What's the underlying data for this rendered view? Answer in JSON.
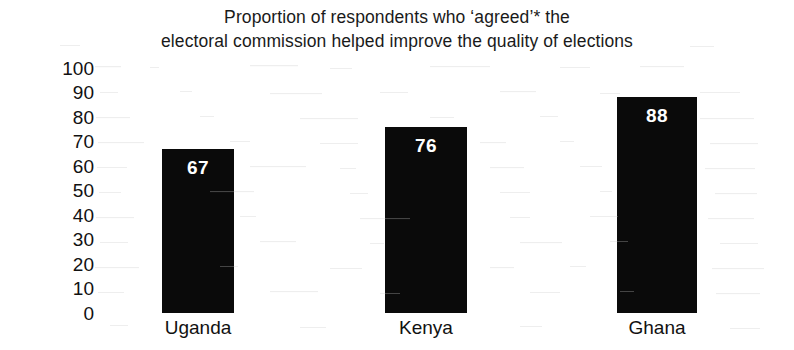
{
  "chart_data": {
    "type": "bar",
    "title": "Proportion of respondents who ‘agreed’* the electoral commission helped improve the quality of elections",
    "title_lines": [
      "Proportion of respondents who ‘agreed’* the",
      "electoral commission helped improve the quality of elections"
    ],
    "categories": [
      "Uganda",
      "Kenya",
      "Ghana"
    ],
    "values": [
      67,
      76,
      88
    ],
    "value_labels": [
      "67",
      "76",
      "88"
    ],
    "xlabel": "",
    "ylabel": "",
    "ylim": [
      0,
      100
    ],
    "y_ticks": [
      100,
      90,
      80,
      70,
      60,
      50,
      40,
      30,
      20,
      10,
      0
    ],
    "y_tick_labels": [
      "100",
      "90",
      "80",
      "70",
      "60",
      "50",
      "40",
      "30",
      "20",
      "10",
      "0"
    ],
    "grid": false,
    "legend": false,
    "legend_position": "none",
    "bar_color": "#0a0a0a",
    "value_label_color": "#ffffff",
    "background_color": "#ffffff",
    "text_color": "#111111"
  }
}
